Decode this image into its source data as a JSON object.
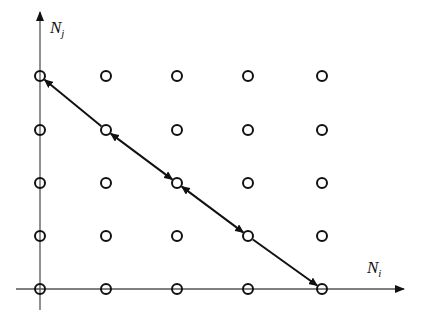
{
  "diagram": {
    "axes": {
      "y_label": "N",
      "y_label_sub": "j",
      "x_label": "N",
      "x_label_sub": "i"
    },
    "grid": {
      "columns": 5,
      "rows": 5,
      "col_x": [
        40,
        106,
        177,
        248,
        322
      ],
      "row_y": [
        76,
        130,
        183,
        236,
        289
      ]
    },
    "path": {
      "points": [
        [
          0,
          4
        ],
        [
          1,
          3
        ],
        [
          2,
          2
        ],
        [
          3,
          1
        ],
        [
          4,
          0
        ]
      ],
      "segments": [
        {
          "from": 0,
          "to": 1,
          "head_start": true,
          "head_end": false
        },
        {
          "from": 1,
          "to": 2,
          "head_start": true,
          "head_end": true
        },
        {
          "from": 2,
          "to": 3,
          "head_start": true,
          "head_end": true
        },
        {
          "from": 3,
          "to": 4,
          "head_start": false,
          "head_end": true
        }
      ]
    },
    "colors": {
      "axis": "#555555",
      "node": "#111111",
      "arrow": "#111111"
    }
  }
}
